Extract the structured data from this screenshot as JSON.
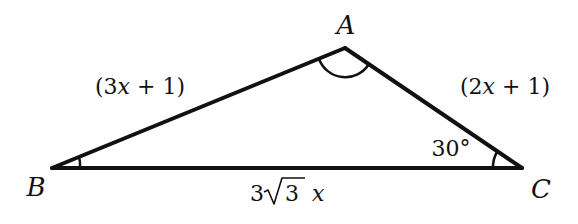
{
  "figure": {
    "type": "triangle",
    "vertices": {
      "A": {
        "label": "A",
        "x": 345,
        "y": 48
      },
      "B": {
        "label": "B",
        "x": 52,
        "y": 168
      },
      "C": {
        "label": "C",
        "x": 522,
        "y": 168
      }
    },
    "sides": {
      "AB": {
        "label_prefix": "(3",
        "label_var": "x",
        "label_suffix": " + 1)"
      },
      "AC": {
        "label_prefix": "(2",
        "label_var": "x",
        "label_suffix": " + 1)"
      },
      "BC": {
        "coef": "3",
        "radicand": "3",
        "var": "x"
      }
    },
    "angles": {
      "A": {
        "marked": true,
        "value": ""
      },
      "B": {
        "marked": true,
        "value": ""
      },
      "C": {
        "marked": true,
        "value": "30°"
      }
    },
    "colors": {
      "stroke": "#111111",
      "background": "#ffffff"
    }
  }
}
